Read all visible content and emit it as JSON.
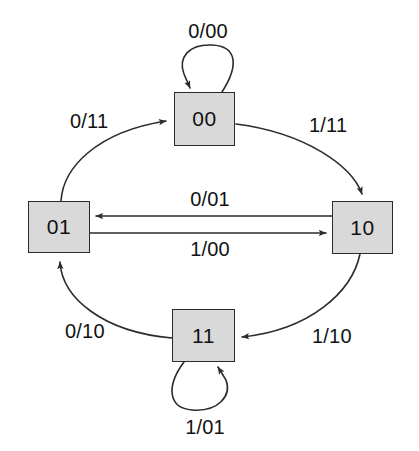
{
  "diagram": {
    "type": "state-transition-diagram",
    "title": "",
    "style": {
      "background_color": "#ffffff",
      "state_fill_color": "#d9d9d9",
      "state_border_color": "#2b2b2b",
      "line_color": "#2b2b2b",
      "text_color": "#111111"
    },
    "states": [
      {
        "id": "s00",
        "label": "00",
        "position": "top",
        "x": 174,
        "y": 92,
        "w": 61,
        "h": 54
      },
      {
        "id": "s01",
        "label": "01",
        "position": "left",
        "x": 28,
        "y": 201,
        "w": 62,
        "h": 52
      },
      {
        "id": "s10",
        "label": "10",
        "position": "right",
        "x": 332,
        "y": 201,
        "w": 61,
        "h": 53
      },
      {
        "id": "s11",
        "label": "11",
        "position": "bottom",
        "x": 172,
        "y": 309,
        "w": 63,
        "h": 53
      }
    ],
    "transitions": [
      {
        "id": "t-00-self",
        "from": "00",
        "to": "00",
        "input": "0",
        "output": "00",
        "label": "0/00",
        "shape": "self-loop-top"
      },
      {
        "id": "t-01-00",
        "from": "01",
        "to": "00",
        "input": "0",
        "output": "11",
        "label": "0/11",
        "shape": "arc-upper-left"
      },
      {
        "id": "t-00-10",
        "from": "00",
        "to": "10",
        "input": "1",
        "output": "11",
        "label": "1/11",
        "shape": "arc-upper-right"
      },
      {
        "id": "t-10-01",
        "from": "10",
        "to": "01",
        "input": "0",
        "output": "01",
        "label": "0/01",
        "shape": "straight-left"
      },
      {
        "id": "t-01-10",
        "from": "01",
        "to": "10",
        "input": "1",
        "output": "00",
        "label": "1/00",
        "shape": "straight-right"
      },
      {
        "id": "t-11-01",
        "from": "11",
        "to": "01",
        "input": "0",
        "output": "10",
        "label": "0/10",
        "shape": "arc-lower-left"
      },
      {
        "id": "t-10-11",
        "from": "10",
        "to": "11",
        "input": "1",
        "output": "10",
        "label": "1/10",
        "shape": "arc-lower-right"
      },
      {
        "id": "t-11-self",
        "from": "11",
        "to": "11",
        "input": "1",
        "output": "01",
        "label": "1/01",
        "shape": "self-loop-bottom"
      }
    ],
    "labels": {
      "loop_top": "0/00",
      "upper_left": "0/11",
      "upper_right": "1/11",
      "middle_upper": "0/01",
      "middle_lower": "1/00",
      "lower_left": "0/10",
      "lower_right": "1/10",
      "loop_bottom": "1/01"
    }
  }
}
